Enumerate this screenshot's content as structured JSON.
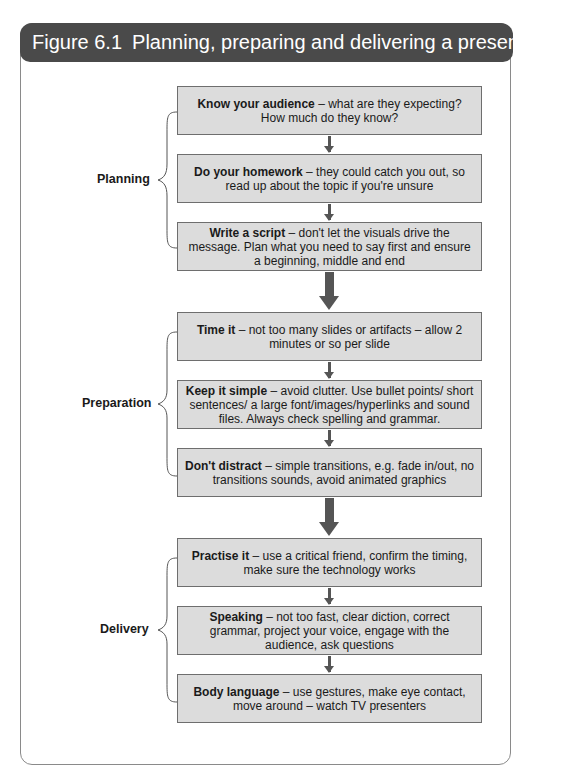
{
  "figure": {
    "number": "Figure 6.1",
    "title": "Planning, preparing and delivering a presentation"
  },
  "groups": [
    {
      "label": "Planning",
      "steps": [
        {
          "bold": "Know your audience",
          "text": " – what are they expecting? How much do they know?"
        },
        {
          "bold": "Do your homework",
          "text": " – they could catch you out, so read up about the topic if you're unsure"
        },
        {
          "bold": "Write a script",
          "text": " – don't let the visuals drive the message. Plan what you need to say first and ensure a beginning, middle and end"
        }
      ]
    },
    {
      "label": "Preparation",
      "steps": [
        {
          "bold": "Time it",
          "text": " – not too many slides or artifacts – allow 2 minutes or so per slide"
        },
        {
          "bold": "Keep it simple",
          "text": " – avoid clutter. Use bullet points/ short sentences/ a large font/images/hyperlinks and sound files. Always check spelling and grammar."
        },
        {
          "bold": "Don't distract",
          "text": " – simple transitions, e.g. fade in/out, no transitions sounds, avoid animated graphics"
        }
      ]
    },
    {
      "label": "Delivery",
      "steps": [
        {
          "bold": "Practise it",
          "text": " – use a critical friend, confirm the timing, make sure the technology works"
        },
        {
          "bold": "Speaking",
          "text": " – not too fast, clear diction, correct grammar, project your voice, engage with the audience, ask questions"
        },
        {
          "bold": "Body language",
          "text": " – use gestures, make eye contact, move around – watch TV presenters"
        }
      ]
    }
  ],
  "colors": {
    "header_bg": "#4a4a4a",
    "box_bg": "#dcdcdc",
    "arrow": "#555555"
  }
}
